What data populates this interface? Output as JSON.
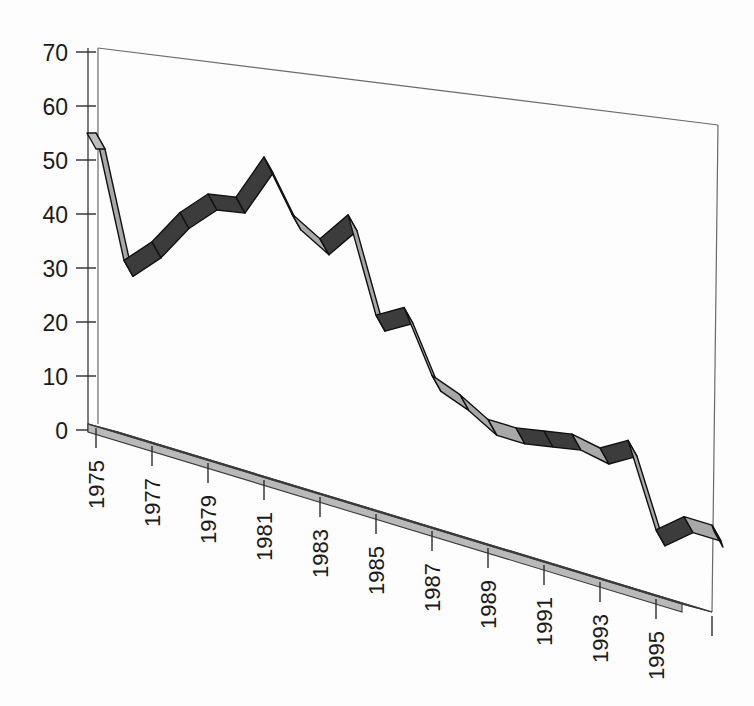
{
  "chart_data": {
    "type": "line",
    "title": "",
    "subtitle": "",
    "xlabel": "",
    "ylabel": "",
    "style": "3d-ribbon-line",
    "grid": false,
    "legend": null,
    "ylim": [
      0,
      70
    ],
    "yticks": [
      0,
      10,
      20,
      30,
      40,
      50,
      60,
      70
    ],
    "ytick_labels": [
      "0",
      "10",
      "20",
      "30",
      "40",
      "50",
      "60",
      "70"
    ],
    "xticks": [
      1975,
      1977,
      1979,
      1981,
      1983,
      1985,
      1987,
      1989,
      1991,
      1993,
      1995,
      1997
    ],
    "xtick_labels": [
      "1975",
      "1977",
      "1979",
      "1981",
      "1983",
      "1985",
      "1987",
      "1989",
      "1991",
      "1993",
      "1995",
      ""
    ],
    "xtick_rotation": 90,
    "x": [
      1975,
      1976,
      1977,
      1978,
      1979,
      1980,
      1981,
      1982,
      1983,
      1984,
      1985,
      1986,
      1987,
      1988,
      1989,
      1990,
      1991,
      1992,
      1993,
      1994,
      1995,
      1996,
      1997
    ],
    "values": [
      55,
      33,
      38,
      45,
      50,
      51,
      60,
      51,
      48,
      54,
      37,
      40,
      29,
      27,
      24,
      24,
      25,
      26,
      25,
      28,
      13,
      17,
      17
    ],
    "series": [
      {
        "name": "series-1",
        "values": [
          55,
          33,
          38,
          45,
          50,
          51,
          60,
          51,
          48,
          54,
          37,
          40,
          29,
          27,
          24,
          24,
          25,
          26,
          25,
          28,
          13,
          17,
          17
        ]
      }
    ],
    "colors": {
      "ribbon_face": "#a8a8a8",
      "ribbon_top": "#3c3c3c",
      "floor_top": "#8d8d8d",
      "floor_front": "#b9b9b9",
      "axis": "#3a3a3a",
      "background": "#fdfdfd"
    }
  },
  "axes": {
    "y_axis_name": "value-axis",
    "x_axis_name": "year-axis"
  }
}
